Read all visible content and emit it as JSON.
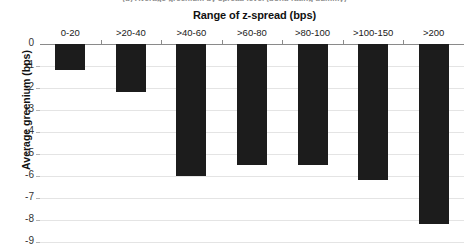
{
  "figure": {
    "caption": "(b) Average greenium by spread level (bond rating dummy)"
  },
  "chart_data": {
    "type": "bar",
    "title": "",
    "xlabel": "Range of z-spread (bps)",
    "ylabel": "Average greenium (bps)",
    "categories": [
      "0-20",
      ">20-40",
      ">40-60",
      ">60-80",
      ">80-100",
      ">100-150",
      ">200"
    ],
    "values": [
      -1.2,
      -2.2,
      -6.0,
      -5.5,
      -5.5,
      -6.2,
      -8.2
    ],
    "ylim": [
      -9,
      0
    ],
    "ytick_labels": [
      "0",
      "-1",
      "-2",
      "-3",
      "-4",
      "-5",
      "-6",
      "-7",
      "-8",
      "-9"
    ],
    "ytick_values": [
      0,
      -1,
      -2,
      -3,
      -4,
      -5,
      -6,
      -7,
      -8,
      -9
    ],
    "grid": true,
    "legend": "none",
    "bar_color": "#1c1c1c",
    "gridline_color": "#e4e4e4",
    "axis_color": "#8a8a8a"
  }
}
